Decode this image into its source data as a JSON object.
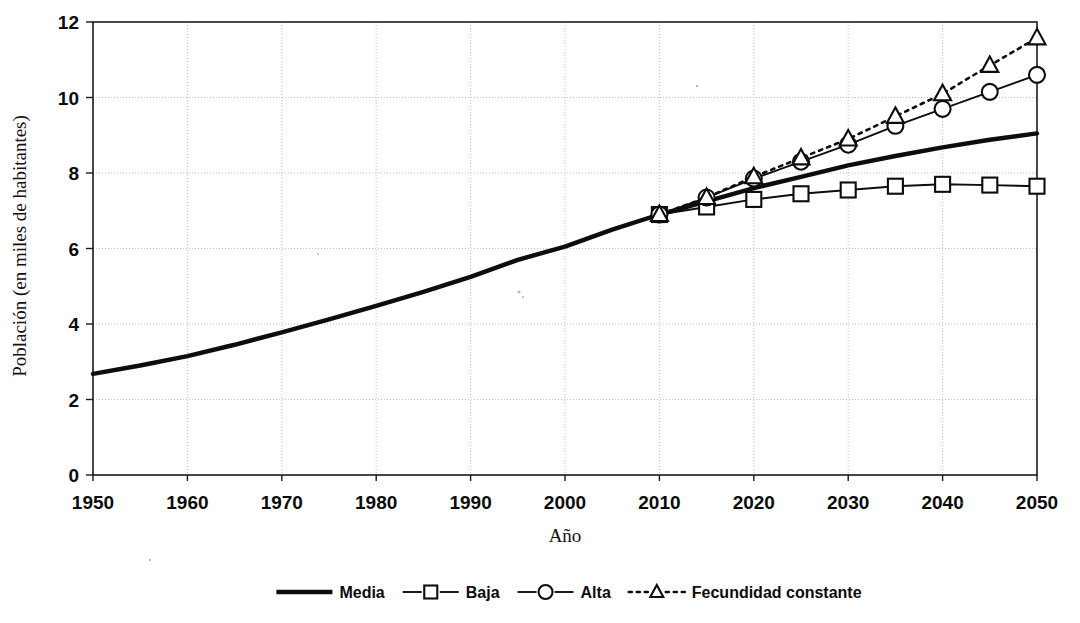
{
  "chart_data": {
    "type": "line",
    "title": "",
    "xlabel": "Año",
    "ylabel": "Población (en miles de habitantes)",
    "xlim": [
      1950,
      2050
    ],
    "ylim": [
      0,
      12
    ],
    "xticks": [
      1950,
      1960,
      1970,
      1980,
      1990,
      2000,
      2010,
      2020,
      2030,
      2040,
      2050
    ],
    "yticks": [
      0,
      2,
      4,
      6,
      8,
      10,
      12
    ],
    "grid": true,
    "legend_position": "bottom",
    "series": [
      {
        "name": "Media",
        "style": "solid-thick",
        "marker": "none",
        "x": [
          1950,
          1955,
          1960,
          1965,
          1970,
          1975,
          1980,
          1985,
          1990,
          1995,
          2000,
          2005,
          2010,
          2015,
          2020,
          2025,
          2030,
          2035,
          2040,
          2045,
          2050
        ],
        "values": [
          2.68,
          2.9,
          3.15,
          3.45,
          3.78,
          4.12,
          4.48,
          4.85,
          5.25,
          5.7,
          6.05,
          6.5,
          6.9,
          7.25,
          7.6,
          7.9,
          8.2,
          8.45,
          8.68,
          8.88,
          9.05
        ]
      },
      {
        "name": "Baja",
        "style": "solid-thin",
        "marker": "square",
        "x": [
          2010,
          2015,
          2020,
          2025,
          2030,
          2035,
          2040,
          2045,
          2050
        ],
        "values": [
          6.9,
          7.1,
          7.3,
          7.45,
          7.55,
          7.65,
          7.7,
          7.68,
          7.65
        ]
      },
      {
        "name": "Alta",
        "style": "solid-thin",
        "marker": "circle",
        "x": [
          2010,
          2015,
          2020,
          2025,
          2030,
          2035,
          2040,
          2045,
          2050
        ],
        "values": [
          6.9,
          7.35,
          7.85,
          8.3,
          8.75,
          9.25,
          9.7,
          10.15,
          10.6
        ]
      },
      {
        "name": "Fecundidad constante",
        "style": "dotted",
        "marker": "triangle",
        "x": [
          2010,
          2015,
          2020,
          2025,
          2030,
          2035,
          2040,
          2045,
          2050
        ],
        "values": [
          6.9,
          7.35,
          7.9,
          8.4,
          8.9,
          9.5,
          10.1,
          10.85,
          11.58
        ]
      }
    ]
  },
  "legend": {
    "items": [
      {
        "label": "Media",
        "style": "solid-thick",
        "marker": "none"
      },
      {
        "label": "Baja",
        "style": "solid-thin",
        "marker": "square"
      },
      {
        "label": "Alta",
        "style": "solid-thin",
        "marker": "circle"
      },
      {
        "label": "Fecundidad constante",
        "style": "dotted",
        "marker": "triangle"
      }
    ]
  },
  "colors": {
    "ink": "#0d0d0d",
    "grid": "#b9b9b9",
    "background": "#ffffff"
  }
}
